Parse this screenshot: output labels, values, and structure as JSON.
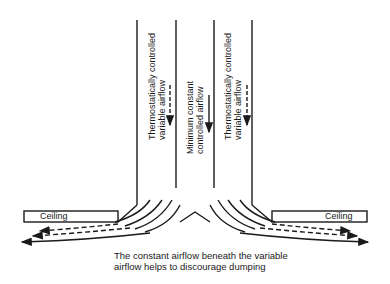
{
  "diagram": {
    "ducts": {
      "left_label_line1": "Thermostatically controlled",
      "left_label_line2": "variable airflow",
      "center_label_line1": "Minimum constant",
      "center_label_line2": "controlled airflow",
      "right_label_line1": "Thermostatically controlled",
      "right_label_line2": "variable airflow"
    },
    "ceiling_left": "Ceiling",
    "ceiling_right": "Ceiling",
    "caption_line1": "The constant airflow beneath the variable",
    "caption_line2": "airflow helps to discourage dumping"
  }
}
